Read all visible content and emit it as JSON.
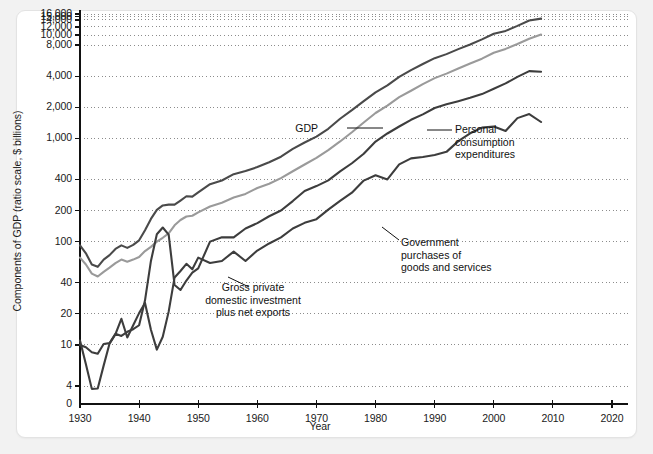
{
  "chart_data": {
    "type": "line",
    "title": "",
    "xlabel": "Year",
    "ylabel": "Components of GDP (ratio scale, $ billions)",
    "scale": "log",
    "xlim": [
      1930,
      2020
    ],
    "ylim": [
      3.2,
      17000
    ],
    "grid": true,
    "legend_position": "inline-annotations",
    "xticks": [
      "1930",
      "1940",
      "1950",
      "1960",
      "1970",
      "1980",
      "1990",
      "2000",
      "2010",
      "2020"
    ],
    "xtick_values": [
      1930,
      1940,
      1950,
      1960,
      1970,
      1980,
      1990,
      2000,
      2010,
      2020
    ],
    "yticks": [
      "16,000",
      "15,000",
      "14,000",
      "12,000",
      "10,000",
      "8,000",
      "4,000",
      "2,000",
      "1,000",
      "400",
      "200",
      "100",
      "40",
      "20",
      "10",
      "4",
      "0"
    ],
    "ytick_values": [
      16000,
      15000,
      14000,
      12000,
      10000,
      8000,
      4000,
      2000,
      1000,
      400,
      200,
      100,
      40,
      20,
      10,
      4,
      0
    ],
    "series": [
      {
        "name": "GDP",
        "color": "#4a4a4a",
        "x": [
          1930,
          1931,
          1932,
          1933,
          1934,
          1935,
          1936,
          1937,
          1938,
          1939,
          1940,
          1941,
          1942,
          1943,
          1944,
          1945,
          1946,
          1947,
          1948,
          1949,
          1950,
          1952,
          1954,
          1956,
          1958,
          1960,
          1962,
          1964,
          1966,
          1968,
          1970,
          1972,
          1974,
          1976,
          1978,
          1980,
          1982,
          1984,
          1986,
          1988,
          1990,
          1992,
          1994,
          1996,
          1998,
          2000,
          2002,
          2004,
          2006,
          2008
        ],
        "values": [
          92,
          77,
          60,
          57,
          67,
          74,
          85,
          92,
          87,
          93,
          103,
          129,
          166,
          203,
          224,
          228,
          228,
          250,
          275,
          273,
          300,
          360,
          391,
          450,
          482,
          527,
          586,
          664,
          791,
          911,
          1038,
          1238,
          1549,
          1874,
          2295,
          2788,
          3255,
          3933,
          4580,
          5252,
          5980,
          6539,
          7309,
          8100,
          9089,
          10285,
          10978,
          12275,
          13856,
          14441
        ],
        "end_value": 14441
      },
      {
        "name": "Personal consumption expenditures",
        "color": "#9a9a9a",
        "x": [
          1930,
          1931,
          1932,
          1933,
          1934,
          1935,
          1936,
          1937,
          1938,
          1939,
          1940,
          1941,
          1942,
          1943,
          1944,
          1945,
          1946,
          1947,
          1948,
          1949,
          1950,
          1952,
          1954,
          1956,
          1958,
          1960,
          1962,
          1964,
          1966,
          1968,
          1970,
          1972,
          1974,
          1976,
          1978,
          1980,
          1982,
          1984,
          1986,
          1988,
          1990,
          1992,
          1994,
          1996,
          1998,
          2000,
          2002,
          2004,
          2006,
          2008
        ],
        "values": [
          70,
          60,
          49,
          46,
          51,
          56,
          62,
          67,
          64,
          67,
          71,
          81,
          89,
          100,
          109,
          120,
          144,
          162,
          175,
          178,
          192,
          219,
          238,
          267,
          290,
          331,
          363,
          412,
          480,
          558,
          646,
          770,
          933,
          1145,
          1425,
          1760,
          2079,
          2503,
          2892,
          3346,
          3831,
          4236,
          4743,
          5316,
          5908,
          6739,
          7351,
          8196,
          9224,
          10129
        ],
        "end_value": 10129
      },
      {
        "name": "Government purchases of goods and services",
        "color": "#3d3d3d",
        "x": [
          1930,
          1931,
          1932,
          1933,
          1934,
          1935,
          1936,
          1937,
          1938,
          1939,
          1940,
          1941,
          1942,
          1943,
          1944,
          1945,
          1946,
          1947,
          1948,
          1949,
          1950,
          1952,
          1954,
          1956,
          1958,
          1960,
          1962,
          1964,
          1966,
          1968,
          1970,
          1972,
          1974,
          1976,
          1978,
          1980,
          1982,
          1984,
          1986,
          1988,
          1990,
          1992,
          1994,
          1996,
          1998,
          2000,
          2002,
          2004,
          2006,
          2008
        ],
        "values": [
          10,
          9.5,
          8.5,
          8.2,
          10.2,
          10.4,
          12.8,
          12.2,
          13.4,
          14.2,
          15.5,
          27,
          65,
          118,
          137,
          117,
          38,
          34,
          42,
          50,
          55,
          100,
          110,
          110,
          134,
          151,
          176,
          200,
          247,
          309,
          345,
          392,
          478,
          574,
          709,
          931,
          1115,
          1302,
          1512,
          1706,
          1969,
          2134,
          2292,
          2470,
          2681,
          3021,
          3404,
          3936,
          4475,
          4420
        ],
        "end_value": 4420
      },
      {
        "name": "Gross private domestic investment plus net exports",
        "color": "#3d3d3d",
        "x": [
          1930,
          1931,
          1932,
          1933,
          1934,
          1935,
          1936,
          1937,
          1938,
          1939,
          1940,
          1941,
          1942,
          1943,
          1944,
          1945,
          1946,
          1947,
          1948,
          1949,
          1950,
          1952,
          1954,
          1956,
          1958,
          1960,
          1962,
          1964,
          1966,
          1968,
          1970,
          1972,
          1974,
          1976,
          1978,
          1980,
          1982,
          1984,
          1986,
          1988,
          1990,
          1992,
          1994,
          1996,
          1998,
          2000,
          2002,
          2004,
          2006,
          2008
        ],
        "values": [
          11,
          6.5,
          3.3,
          3.4,
          6.3,
          10.3,
          12.7,
          17.9,
          11.8,
          15.5,
          20.3,
          25.5,
          14,
          9,
          12,
          21,
          45,
          52,
          61,
          54,
          70,
          62,
          65,
          80,
          65,
          82,
          96,
          110,
          134,
          152,
          165,
          204,
          248,
          298,
          390,
          440,
          400,
          560,
          640,
          660,
          690,
          740,
          940,
          1120,
          1270,
          1300,
          1180,
          1570,
          1720,
          1440
        ],
        "end_value": 1440
      }
    ],
    "annotations": [
      {
        "id": "gdp",
        "text": "GDP",
        "align": "right",
        "x": 318,
        "y": 122,
        "leader": {
          "x1": 347,
          "y1": 128,
          "x2": 383,
          "y2": 128
        }
      },
      {
        "id": "pce",
        "text": "Personal\nconsumption\nexpenditures",
        "align": "left",
        "x": 455,
        "y": 123,
        "leader": {
          "x1": 427,
          "y1": 130,
          "x2": 452,
          "y2": 130
        }
      },
      {
        "id": "gov",
        "text": "Government\npurchases of\ngoods and services",
        "align": "left",
        "x": 401,
        "y": 236,
        "leader": {
          "x1": 399,
          "y1": 240,
          "x2": 382,
          "y2": 227
        }
      },
      {
        "id": "gpdi",
        "text": "Gross private\ndomestic investment\nplus net exports",
        "align": "center",
        "x": 253,
        "y": 281,
        "leader": {
          "x1": 249,
          "y1": 287,
          "x2": 228,
          "y2": 277
        }
      }
    ]
  },
  "style": {
    "page_background": "#f2f2f2",
    "card_background": "#ffffff",
    "axis_color": "#111111",
    "grid_color": "#8c8c8c",
    "text_color": "#1a1a1a"
  }
}
